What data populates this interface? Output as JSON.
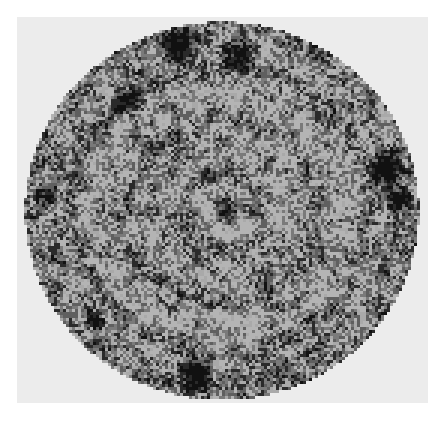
{
  "image": {
    "description": "Grayscale circular speckle pattern with concentric ring structure and dark blotches, on light gray square panel",
    "width": 446,
    "height": 421,
    "background_color": "#ffffff",
    "panel": {
      "x": 17,
      "y": 17,
      "width": 411,
      "height": 386,
      "color": "#ececec"
    },
    "disc": {
      "center_x": 222,
      "center_y": 211,
      "radius_x": 197,
      "radius_y": 189,
      "pixel_block": 3,
      "palette": [
        "#b4b4b4",
        "#a9a9a9",
        "#7a7a7a",
        "#5f5f5f",
        "#2a2a2a",
        "#111111"
      ],
      "dark_blotches": [
        {
          "x": 180,
          "y": 45,
          "r": 14
        },
        {
          "x": 125,
          "y": 100,
          "r": 12
        },
        {
          "x": 240,
          "y": 55,
          "r": 13
        },
        {
          "x": 385,
          "y": 170,
          "r": 14
        },
        {
          "x": 45,
          "y": 195,
          "r": 9
        },
        {
          "x": 195,
          "y": 375,
          "r": 14
        },
        {
          "x": 95,
          "y": 320,
          "r": 8
        },
        {
          "x": 230,
          "y": 210,
          "r": 12
        },
        {
          "x": 400,
          "y": 200,
          "r": 10
        }
      ],
      "rings": [
        40,
        95,
        150
      ]
    }
  }
}
